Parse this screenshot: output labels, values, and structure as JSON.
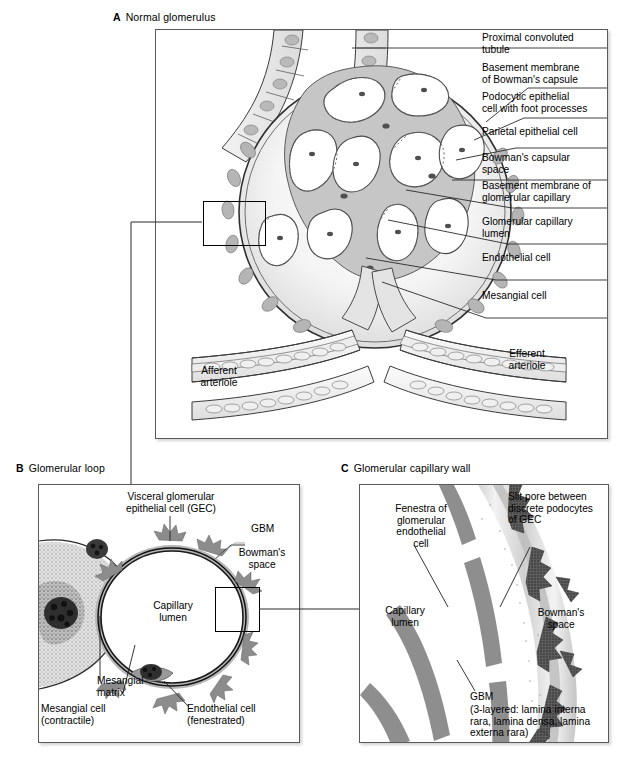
{
  "figure": {
    "panels": [
      {
        "key": "A",
        "letter": "A",
        "title": "Normal glomerulus"
      },
      {
        "key": "B",
        "letter": "B",
        "title": "Glomerular loop"
      },
      {
        "key": "C",
        "letter": "C",
        "title": "Glomerular capillary wall"
      }
    ]
  },
  "panelA": {
    "letter": "A",
    "title": "Normal glomerulus",
    "right_labels": [
      "Proximal convoluted\ntubule",
      "Basement membrane\nof Bowman's capsule",
      "Podocytic epithelial\ncell with foot processes",
      "Parietal epithelial cell",
      "Bowman's capsular\nspace",
      "Basement membrane of\nglomerular capillary",
      "Glomerular capillary\nlumen",
      "Endothelial cell",
      "Mesangial cell"
    ],
    "inner_labels": {
      "afferent": "Afferent\narteriole",
      "efferent": "Efferent\narteriole"
    }
  },
  "panelB": {
    "letter": "B",
    "title": "Glomerular loop",
    "labels": {
      "gec": "Visceral glomerular\nepithelial cell (GEC)",
      "gbm": "GBM",
      "bowmans_space": "Bowman's\nspace",
      "capillary_lumen": "Capillary\nlumen",
      "mesangial_matrix": "Mesangial\nmatrix",
      "mesangial_cell": "Mesangial cell\n(contractile)",
      "endothelial_cell": "Endothelial cell\n(fenestrated)"
    }
  },
  "panelC": {
    "letter": "C",
    "title": "Glomerular capillary wall",
    "labels": {
      "fenestra": "Fenestra of\nglomerular\nendothelial\ncell",
      "slit_pore": "Slit pore between\ndiscrete podocytes\nof GEC",
      "capillary_lumen": "Capillary\nlumen",
      "bowmans_space": "Bowman's\nspace",
      "gbm_title": "GBM",
      "gbm_detail": "(3-layered: lamina interna\nrara, lamina densa, lamina\nexterna rara)"
    }
  },
  "colors": {
    "frame": "#5a5a5a",
    "leader": "#2a2a2a",
    "ink": "#000000",
    "cell_fill": "#bdbdbd",
    "matrix_fill": "#d6d6d6",
    "nucleus": "#3a3a3a",
    "lumen": "#ffffff"
  }
}
